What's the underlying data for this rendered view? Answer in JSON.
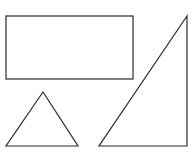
{
  "canvas": {
    "width": 195,
    "height": 158,
    "background": "#ffffff"
  },
  "stroke": {
    "color": "#2a2a2a",
    "width": 1.2
  },
  "shapes": [
    {
      "type": "rectangle",
      "name": "rectangle",
      "x": 6,
      "y": 16,
      "width": 127,
      "height": 63
    },
    {
      "type": "triangle",
      "name": "equilateral-triangle",
      "points": "43,92 6,146 78,146"
    },
    {
      "type": "triangle",
      "name": "right-triangle",
      "points": "187,16 99,146 187,146"
    }
  ]
}
